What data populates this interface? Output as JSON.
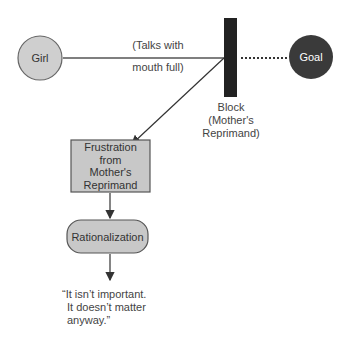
{
  "nodes": {
    "girl": {
      "label": "Girl",
      "fill": "#cfcfcf"
    },
    "goal": {
      "label": "Goal",
      "fill": "#3a3a3a",
      "text_color": "#ffffff"
    },
    "block": {
      "label_lines": [
        "Block",
        "(Mother's",
        "Reprimand)"
      ],
      "fill": "#222222"
    },
    "frustration": {
      "label_lines": [
        "Frustration",
        "from",
        "Mother's",
        "Reprimand"
      ],
      "fill": "#c8c8c8"
    },
    "rationalization": {
      "label": "Rationalization",
      "fill": "#c8c8c8"
    }
  },
  "edges": {
    "girl_to_block": {
      "label_lines": [
        "(Talks with",
        "mouth full)"
      ]
    }
  },
  "quote": {
    "lines": [
      "“It isn’t important.",
      "It doesn’t matter",
      "anyway.”"
    ]
  }
}
